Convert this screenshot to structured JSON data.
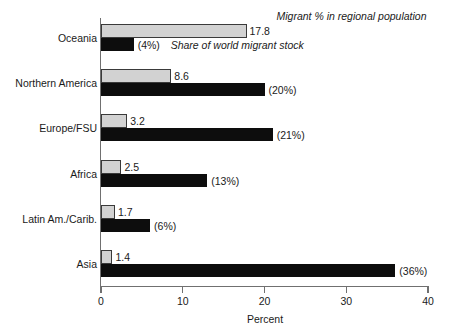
{
  "chart_data": {
    "type": "bar",
    "orientation": "horizontal",
    "title": "",
    "xlabel": "Percent",
    "ylabel": "",
    "xlim": [
      0,
      40
    ],
    "xticks": [
      0,
      10,
      20,
      30,
      40
    ],
    "xtick_labels": [
      "0",
      "10",
      "20",
      "30",
      "40"
    ],
    "grid": false,
    "legend_position": "inline-top",
    "categories": [
      "Oceania",
      "Northern America",
      "Europe/FSU",
      "Africa",
      "Latin Am./Carib.",
      "Asia"
    ],
    "series": [
      {
        "name": "Migrant % in regional population",
        "color": "#d2d2d2",
        "values": [
          17.8,
          8.6,
          3.2,
          2.5,
          1.7,
          1.4
        ],
        "labels": [
          "17.8",
          "8.6",
          "3.2",
          "2.5",
          "1.7",
          "1.4"
        ]
      },
      {
        "name": "Share of world migrant stock",
        "color": "#0d0d0d",
        "values": [
          4,
          20,
          21,
          13,
          6,
          36
        ],
        "labels": [
          "(4%)",
          "(20%)",
          "(21%)",
          "(13%)",
          "(6%)",
          "(36%)"
        ]
      }
    ],
    "annotations": [
      "Migrant % in regional population",
      "Share of world migrant stock"
    ]
  },
  "legend": {
    "series_one_label": "Migrant % in regional population",
    "series_two_label": "Share of world migrant stock"
  },
  "axis": {
    "x_title": "Percent"
  }
}
